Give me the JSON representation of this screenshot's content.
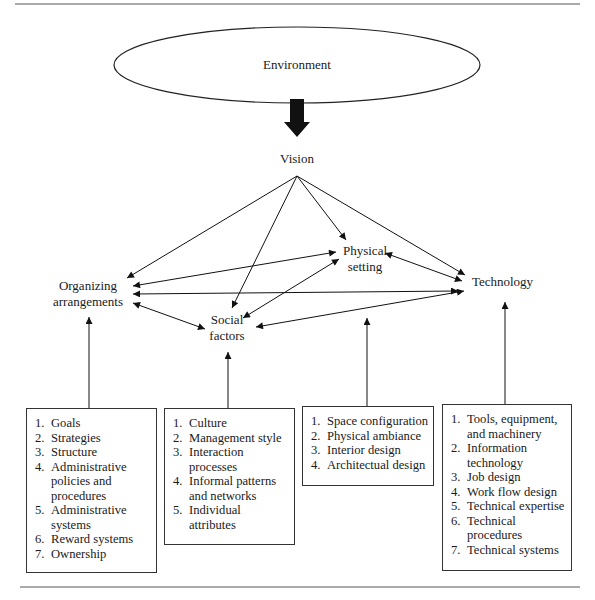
{
  "diagram": {
    "environment": "Environment",
    "vision": "Vision",
    "nodes": {
      "organizing": [
        "Organizing",
        "arrangements"
      ],
      "physical": [
        "Physical",
        "setting"
      ],
      "social": [
        "Social",
        "factors"
      ],
      "technology": [
        "Technology"
      ]
    },
    "boxes": [
      {
        "id": "organizing-arrangements",
        "items": [
          "Goals",
          "Strategies",
          "Structure",
          "Administrative policies and procedures",
          "Administrative systems",
          "Reward systems",
          "Ownership"
        ]
      },
      {
        "id": "social-factors",
        "items": [
          "Culture",
          "Management style",
          "Interaction processes",
          "Informal patterns and networks",
          "Individual attributes"
        ]
      },
      {
        "id": "physical-setting",
        "items": [
          "Space configuration",
          "Physical ambiance",
          "Interior design",
          "Architectual design"
        ]
      },
      {
        "id": "technology",
        "items": [
          "Tools, equipment, and machinery",
          "Information technology",
          "Job design",
          "Work flow design",
          "Technical expertise",
          "Technical procedures",
          "Technical systems"
        ]
      }
    ],
    "edges": [
      {
        "from": "Environment",
        "to": "Vision",
        "style": "thick"
      },
      {
        "from": "Vision",
        "to": "Organizing arrangements"
      },
      {
        "from": "Vision",
        "to": "Social factors"
      },
      {
        "from": "Vision",
        "to": "Physical setting"
      },
      {
        "from": "Vision",
        "to": "Technology"
      },
      {
        "from": "Organizing arrangements",
        "to": "Physical setting",
        "bidirectional": true
      },
      {
        "from": "Organizing arrangements",
        "to": "Technology",
        "bidirectional": true
      },
      {
        "from": "Organizing arrangements",
        "to": "Social factors",
        "bidirectional": true
      },
      {
        "from": "Social factors",
        "to": "Physical setting",
        "bidirectional": true
      },
      {
        "from": "Social factors",
        "to": "Technology",
        "bidirectional": true
      },
      {
        "from": "Physical setting",
        "to": "Technology",
        "bidirectional": true
      }
    ]
  }
}
